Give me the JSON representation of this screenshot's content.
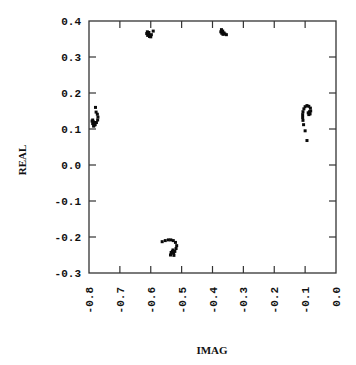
{
  "chart_data": {
    "type": "scatter",
    "title": "",
    "xlabel": "IMAG",
    "ylabel": "REAL",
    "xlim": [
      -0.8,
      0.0
    ],
    "ylim": [
      -0.3,
      0.4
    ],
    "grid": false,
    "legend": null,
    "xticks": [
      -0.8,
      -0.7,
      -0.6,
      -0.5,
      -0.4,
      -0.3,
      -0.2,
      -0.1,
      0.0
    ],
    "xtick_labels": [
      "-0.8",
      "-0.7",
      "-0.6",
      "-0.5",
      "-0.4",
      "-0.3",
      "-0.2",
      "-0.1",
      "0.0"
    ],
    "yticks": [
      0.4,
      0.3,
      0.2,
      0.1,
      0.0,
      -0.1,
      -0.2,
      -0.3
    ],
    "ytick_labels": [
      "0.4",
      "0.3",
      "0.2",
      "0.1",
      "0.0",
      "-0.1",
      "-0.2",
      "-0.3"
    ],
    "series": [
      {
        "name": "cluster-left",
        "points": [
          [
            -0.788,
            0.115
          ],
          [
            -0.786,
            0.12
          ],
          [
            -0.784,
            0.11
          ],
          [
            -0.782,
            0.118
          ],
          [
            -0.79,
            0.122
          ],
          [
            -0.788,
            0.125
          ],
          [
            -0.785,
            0.108
          ],
          [
            -0.78,
            0.112
          ],
          [
            -0.776,
            0.118
          ],
          [
            -0.772,
            0.125
          ],
          [
            -0.771,
            0.133
          ],
          [
            -0.773,
            0.141
          ],
          [
            -0.777,
            0.147
          ],
          [
            -0.779,
            0.16
          ]
        ]
      },
      {
        "name": "cluster-top-left",
        "points": [
          [
            -0.613,
            0.365
          ],
          [
            -0.61,
            0.36
          ],
          [
            -0.607,
            0.362
          ],
          [
            -0.611,
            0.37
          ],
          [
            -0.606,
            0.368
          ],
          [
            -0.604,
            0.357
          ],
          [
            -0.6,
            0.356
          ],
          [
            -0.598,
            0.362
          ],
          [
            -0.592,
            0.372
          ]
        ]
      },
      {
        "name": "cluster-top-right",
        "points": [
          [
            -0.373,
            0.37
          ],
          [
            -0.37,
            0.366
          ],
          [
            -0.367,
            0.372
          ],
          [
            -0.371,
            0.376
          ],
          [
            -0.366,
            0.363
          ],
          [
            -0.363,
            0.367
          ],
          [
            -0.36,
            0.364
          ],
          [
            -0.355,
            0.362
          ]
        ]
      },
      {
        "name": "cluster-right",
        "points": [
          [
            -0.09,
            0.145
          ],
          [
            -0.086,
            0.148
          ],
          [
            -0.088,
            0.14
          ],
          [
            -0.084,
            0.142
          ],
          [
            -0.082,
            0.15
          ],
          [
            -0.083,
            0.158
          ],
          [
            -0.088,
            0.163
          ],
          [
            -0.094,
            0.165
          ],
          [
            -0.1,
            0.162
          ],
          [
            -0.104,
            0.156
          ],
          [
            -0.107,
            0.148
          ],
          [
            -0.108,
            0.14
          ],
          [
            -0.108,
            0.132
          ],
          [
            -0.107,
            0.124
          ],
          [
            -0.105,
            0.112
          ],
          [
            -0.1,
            0.095
          ],
          [
            -0.094,
            0.068
          ]
        ]
      },
      {
        "name": "cluster-bottom",
        "points": [
          [
            -0.53,
            -0.24
          ],
          [
            -0.526,
            -0.245
          ],
          [
            -0.534,
            -0.243
          ],
          [
            -0.528,
            -0.236
          ],
          [
            -0.522,
            -0.24
          ],
          [
            -0.518,
            -0.232
          ],
          [
            -0.516,
            -0.224
          ],
          [
            -0.52,
            -0.215
          ],
          [
            -0.527,
            -0.21
          ],
          [
            -0.535,
            -0.208
          ],
          [
            -0.543,
            -0.208
          ],
          [
            -0.553,
            -0.21
          ],
          [
            -0.563,
            -0.213
          ],
          [
            -0.536,
            -0.25
          ],
          [
            -0.525,
            -0.251
          ]
        ]
      }
    ]
  }
}
